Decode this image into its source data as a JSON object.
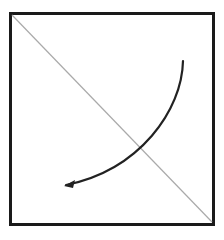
{
  "diagram": {
    "width": 224,
    "height": 240,
    "background": "#ffffff",
    "box": {
      "x": 10.5,
      "y": 13.5,
      "w": 203,
      "h": 211,
      "stroke": "#1a1a1a",
      "stroke_width": 3
    },
    "diagonal": {
      "x1": 12,
      "y1": 15,
      "x2": 212,
      "y2": 222,
      "stroke": "#aaaaaa",
      "stroke_width": 1.2
    },
    "arrow": {
      "path": "M 183 61 C 182 110, 140 170, 66 185",
      "stroke": "#222222",
      "stroke_width": 2.2,
      "head": "64,186 75,180 73,188"
    }
  }
}
